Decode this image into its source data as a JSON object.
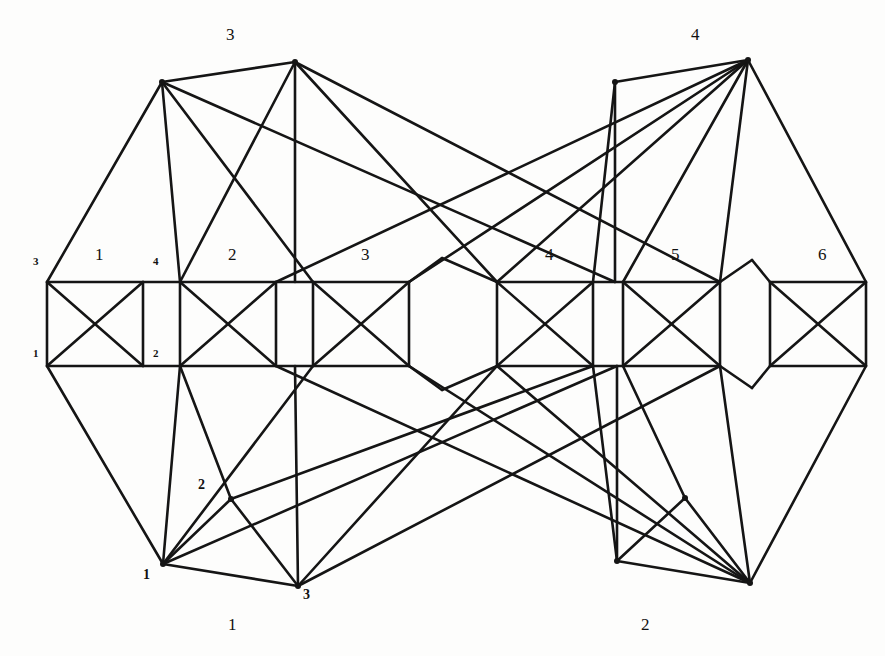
{
  "figure": {
    "background_color": "#fdfdfc",
    "line_color": "#151515"
  },
  "boxes": [
    {
      "id": "box1",
      "label": "1",
      "x": 47,
      "y": 282,
      "w": 96,
      "h": 84,
      "corners": {
        "tl": "3",
        "tr": "4",
        "bl": "1",
        "br": "2"
      }
    },
    {
      "id": "box2",
      "label": "2",
      "x": 180,
      "y": 282,
      "w": 96,
      "h": 84,
      "corners": {
        "tl": "",
        "tr": "",
        "bl": "",
        "br": ""
      }
    },
    {
      "id": "box3",
      "label": "3",
      "x": 313,
      "y": 282,
      "w": 96,
      "h": 84,
      "corners": {
        "tl": "",
        "tr": "",
        "bl": "",
        "br": ""
      }
    },
    {
      "id": "box4",
      "label": "4",
      "x": 497,
      "y": 282,
      "w": 96,
      "h": 84,
      "corners": {
        "tl": "",
        "tr": "",
        "bl": "",
        "br": ""
      }
    },
    {
      "id": "box5",
      "label": "5",
      "x": 623,
      "y": 282,
      "w": 97,
      "h": 84,
      "corners": {
        "tl": "",
        "tr": "",
        "bl": "",
        "br": ""
      }
    },
    {
      "id": "box6",
      "label": "6",
      "x": 770,
      "y": 282,
      "w": 96,
      "h": 84,
      "corners": {
        "tl": "",
        "tr": "",
        "bl": "",
        "br": ""
      }
    }
  ],
  "box_labels": [
    {
      "text": "1",
      "x": 95,
      "y": 256
    },
    {
      "text": "2",
      "x": 228,
      "y": 256
    },
    {
      "text": "3",
      "x": 361,
      "y": 256
    },
    {
      "text": "4",
      "x": 545,
      "y": 256
    },
    {
      "text": "5",
      "x": 671,
      "y": 256
    },
    {
      "text": "6",
      "x": 818,
      "y": 256
    }
  ],
  "corner_labels": [
    {
      "text": "3",
      "x": 38,
      "y": 262,
      "anchor": "end"
    },
    {
      "text": "4",
      "x": 155,
      "y": 262,
      "anchor": "start"
    },
    {
      "text": "1",
      "x": 38,
      "y": 352,
      "anchor": "end"
    },
    {
      "text": "2",
      "x": 155,
      "y": 352,
      "anchor": "start"
    }
  ],
  "outer_vertices": [
    {
      "id": "t1",
      "x": 162,
      "y": 82,
      "label": "",
      "label_x": 0,
      "label_y": 0
    },
    {
      "id": "t2",
      "x": 295,
      "y": 62,
      "label": "",
      "label_x": 0,
      "label_y": 0
    },
    {
      "id": "t3",
      "x": 615,
      "y": 82,
      "label": "",
      "label_x": 0,
      "label_y": 0
    },
    {
      "id": "t4",
      "x": 748,
      "y": 60,
      "label": "",
      "label_x": 0,
      "label_y": 0
    },
    {
      "id": "b1",
      "x": 163,
      "y": 564,
      "label": "1",
      "label_x": 145,
      "label_y": 570
    },
    {
      "id": "b2",
      "x": 231,
      "y": 499,
      "label": "2",
      "label_x": 200,
      "label_y": 482
    },
    {
      "id": "b3",
      "x": 298,
      "y": 586,
      "label": "3",
      "label_x": 305,
      "label_y": 592
    },
    {
      "id": "b4",
      "x": 617,
      "y": 561,
      "label": "",
      "label_x": 0,
      "label_y": 0
    },
    {
      "id": "b5",
      "x": 685,
      "y": 498,
      "label": "",
      "label_x": 0,
      "label_y": 0
    },
    {
      "id": "b6",
      "x": 750,
      "y": 583,
      "label": "",
      "label_x": 0,
      "label_y": 0
    }
  ],
  "apex_labels": [
    {
      "text": "3",
      "x": 231,
      "y": 32
    },
    {
      "text": "4",
      "x": 696,
      "y": 32
    }
  ],
  "bottom_group_labels": [
    {
      "text": "1",
      "x": 232,
      "y": 618
    },
    {
      "text": "2",
      "x": 645,
      "y": 618
    }
  ],
  "graph_data": {
    "type": "diagram",
    "description": "Six complete-graph-on-four-vertices boxes in a row, joined by outer vertices forming two symmetric clusters",
    "box_count": 6,
    "box_internal_edges": [
      "top",
      "bottom",
      "left",
      "right",
      "diagonal-nw-se",
      "diagonal-ne-sw"
    ],
    "outer_vertex_count": 10,
    "symmetry": "left-right mirror"
  }
}
